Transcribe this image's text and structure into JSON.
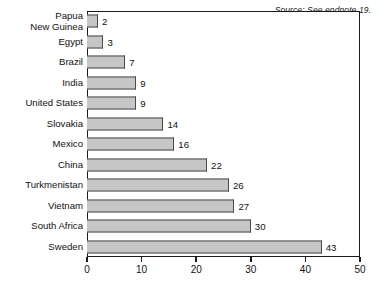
{
  "source_note": "Source: See endnote 19.",
  "chart_data": {
    "type": "bar",
    "orientation": "horizontal",
    "title": "",
    "xlabel": "",
    "ylabel": "",
    "xlim": [
      0,
      50
    ],
    "xticks": [
      0,
      10,
      20,
      30,
      40,
      50
    ],
    "xtick_labels": [
      "0",
      "10",
      "20",
      "30",
      "40",
      "50"
    ],
    "grid": false,
    "legend": false,
    "bar_color": "#c6c6c6",
    "bar_edge_color": "#4a4a4a",
    "categories": [
      "Papua\nNew Guinea",
      "Egypt",
      "Brazil",
      "India",
      "United States",
      "Slovakia",
      "Mexico",
      "China",
      "Turkmenistan",
      "Vietnam",
      "South Africa",
      "Sweden"
    ],
    "values": [
      2,
      3,
      7,
      9,
      9,
      14,
      16,
      22,
      26,
      27,
      30,
      43
    ],
    "value_labels": [
      "2",
      "3",
      "7",
      "9",
      "9",
      "14",
      "16",
      "22",
      "26",
      "27",
      "30",
      "43"
    ]
  }
}
